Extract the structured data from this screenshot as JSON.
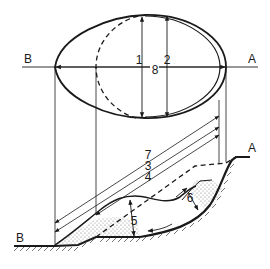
{
  "diagram": {
    "colors": {
      "line": "#1a1a1a",
      "background": "#ffffff",
      "stipple": "#8a8a8a"
    },
    "plan_view": {
      "axis_label_left": "B",
      "axis_label_right": "A",
      "labels": {
        "d1": "1",
        "d2": "2",
        "d8": "8"
      }
    },
    "section_view": {
      "label_left": "B",
      "label_right": "A",
      "labels": {
        "d7": "7",
        "d3": "3",
        "d4": "4",
        "d5": "5",
        "d6": "6"
      }
    }
  }
}
